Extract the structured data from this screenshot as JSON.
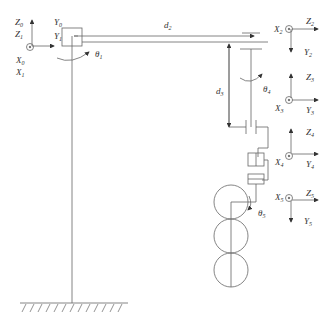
{
  "diagram": {
    "type": "robot-arm-kinematic-schematic",
    "line_color": "#555555",
    "frames": [
      {
        "id": "frame-0-1",
        "z_label": "Z",
        "z_sub": "0",
        "z2_label": "Z",
        "z2_sub": "1",
        "y_label": "Y",
        "y_sub": "0",
        "y2_label": "Y",
        "y2_sub": "1",
        "x_label": "X",
        "x_sub": "0",
        "x2_label": "X",
        "x2_sub": "1"
      },
      {
        "id": "frame-2",
        "x_label": "X",
        "x_sub": "2",
        "z_label": "Z",
        "z_sub": "2",
        "y_label": "Y",
        "y_sub": "2"
      },
      {
        "id": "frame-3",
        "z_label": "Z",
        "z_sub": "3",
        "x_label": "X",
        "x_sub": "3",
        "y_label": "Y",
        "y_sub": "3"
      },
      {
        "id": "frame-4",
        "z_label": "Z",
        "z_sub": "4",
        "x_label": "X",
        "x_sub": "4",
        "y_label": "Y",
        "y_sub": "4"
      },
      {
        "id": "frame-5",
        "x_label": "X",
        "x_sub": "5",
        "z_label": "Z",
        "z_sub": "5",
        "y_label": "Y",
        "y_sub": "5"
      }
    ],
    "joints": [
      {
        "label": "θ",
        "sub": "1"
      },
      {
        "label": "d",
        "sub": "2"
      },
      {
        "label": "d",
        "sub": "3"
      },
      {
        "label": "θ",
        "sub": "4"
      },
      {
        "label": "θ",
        "sub": "5"
      }
    ]
  }
}
